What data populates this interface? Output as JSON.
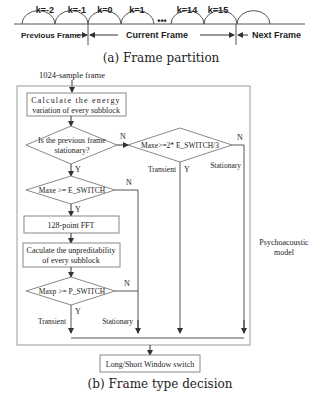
{
  "partition": {
    "blocks": [
      "k=-2",
      "k=-1",
      "k=0",
      "k=1",
      "k=14",
      "k=15"
    ],
    "ellipsis": "•••",
    "previous_frame": "Previous Frame",
    "current_frame": "Current Frame",
    "next_frame": "Next Frame",
    "caption": "(a) Frame partition"
  },
  "flow": {
    "input_label": "1024-sample frame",
    "energy_box": [
      "Calculate the energy",
      "variation of every subblock"
    ],
    "prev_stationary": [
      "Is the previous frame",
      "stationary?"
    ],
    "maxe_esw": "Maxe >= E_SWITCH",
    "maxe_2esw": "Maxe>=2* E_SWITCH/3",
    "fft_box": "128-point FFT",
    "unpred_box": [
      "Caculate the unpreditability",
      "of every subblock"
    ],
    "maxp_psw": "Maxp >= P_SWITCH",
    "switch_box": "Long/Short Window switch",
    "psycho": [
      "Psychoacoustic",
      "model"
    ],
    "yes": "Y",
    "no": "N",
    "transient": "Transient",
    "stationary": "Stationary",
    "caption": "(b) Frame type decision"
  },
  "colors": {
    "line": "#555555",
    "box": "#888888",
    "text": "#222222"
  }
}
